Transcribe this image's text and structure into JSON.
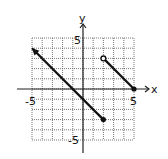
{
  "chart_data": {
    "type": "line",
    "title": "",
    "xlabel": "x",
    "ylabel": "y",
    "xlim": [
      -5,
      5
    ],
    "ylim": [
      -5,
      5
    ],
    "grid": true,
    "tick_labels": {
      "x": [
        "-5",
        "5"
      ],
      "y": [
        "5",
        "-5"
      ]
    },
    "series": [
      {
        "name": "ray",
        "points": [
          [
            -5,
            4
          ],
          [
            2,
            -3
          ]
        ],
        "start": "arrow",
        "end": "closed",
        "slope": -1
      },
      {
        "name": "segment",
        "points": [
          [
            2,
            3
          ],
          [
            5,
            0
          ]
        ],
        "start": "open",
        "end": "closed",
        "slope": -1
      }
    ]
  },
  "labels": {
    "x_axis": "x",
    "y_axis": "y",
    "x_min": "-5",
    "x_max": "5",
    "y_max": "5",
    "y_min": "-5"
  }
}
